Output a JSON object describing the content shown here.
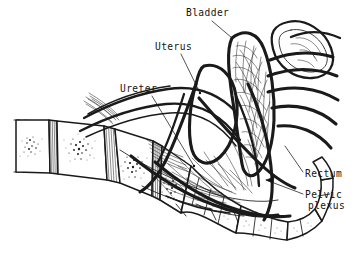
{
  "figure": {
    "style": "pen-and-ink line drawing",
    "background_color": "#ffffff",
    "ink_color": "#1a1a1a",
    "width": 361,
    "height": 269
  },
  "labels": [
    {
      "id": "bladder",
      "text": "Bladder",
      "x": 186,
      "y": 16,
      "anchor": "start",
      "leader": {
        "from": [
          212,
          21
        ],
        "to": [
          232,
          38
        ],
        "arrow": false,
        "dot": false
      }
    },
    {
      "id": "uterus",
      "text": "Uterus",
      "x": 155,
      "y": 50,
      "anchor": "start",
      "leader": {
        "from": [
          181,
          54
        ],
        "to": [
          200,
          93
        ],
        "arrow": false,
        "dot": true
      }
    },
    {
      "id": "ureter",
      "text": "Ureter",
      "x": 120,
      "y": 92,
      "anchor": "start",
      "leader": {
        "from": [
          152,
          96
        ],
        "to": [
          194,
          166
        ],
        "arrow": false,
        "dot": true
      }
    },
    {
      "id": "rectum",
      "text": "Rectum",
      "x": 305,
      "y": 177,
      "anchor": "start",
      "leader": {
        "from": [
          303,
          172
        ],
        "to": [
          285,
          146
        ],
        "arrow": false,
        "dot": false
      }
    },
    {
      "id": "pelvic-plexus",
      "text": "Pelvic",
      "text_line2": "plexus",
      "x": 305,
      "y": 198,
      "x2": 308,
      "y2": 209,
      "anchor": "start",
      "leader": {
        "from": [
          303,
          194
        ],
        "to": [
          266,
          180
        ],
        "arrow": true,
        "dot": false
      }
    }
  ],
  "structures": [
    {
      "id": "lumbar-vertebrae",
      "name": "lumbar vertebral bodies",
      "count": 4,
      "texture": "stippled cancellous bone"
    },
    {
      "id": "intervertebral-discs",
      "name": "intervertebral discs",
      "texture": "vertical hatching"
    },
    {
      "id": "sacrum",
      "name": "sacrum",
      "texture": "stippled"
    },
    {
      "id": "coccyx",
      "name": "coccyx segments",
      "count": 4
    },
    {
      "id": "bladder",
      "name": "urinary bladder",
      "texture": "nerve mesh over dome"
    },
    {
      "id": "uterus",
      "name": "uterus",
      "texture": "plain outline"
    },
    {
      "id": "ovary",
      "name": "ovary",
      "texture": "concentric oval"
    },
    {
      "id": "rectum",
      "name": "rectum",
      "texture": "thick curved outline"
    },
    {
      "id": "ureters",
      "name": "ureters",
      "texture": "paired long tubes"
    },
    {
      "id": "sacral-roots",
      "name": "sacral nerve roots",
      "count": 5
    },
    {
      "id": "pelvic-plexus",
      "name": "pelvic (inferior hypogastric) plexus",
      "texture": "fine interlacing fibres"
    }
  ]
}
